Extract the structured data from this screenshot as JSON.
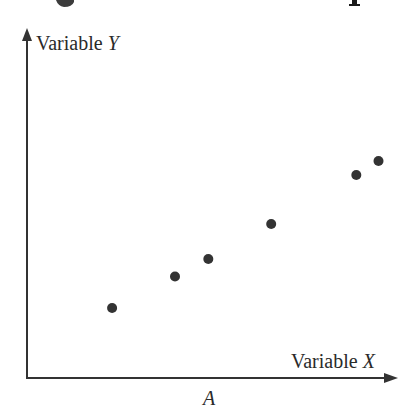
{
  "figure": {
    "title_fragment": "g                                    p",
    "caption": "A"
  },
  "colors": {
    "axis": "#333333",
    "point": "#333333",
    "text": "#2a2a2a",
    "background": "#ffffff"
  },
  "chart_data": {
    "type": "scatter",
    "title": "",
    "xlabel": "Variable X",
    "ylabel": "Variable Y",
    "caption": "A",
    "xlim": [
      0,
      10
    ],
    "ylim": [
      0,
      10
    ],
    "grid": false,
    "legend": null,
    "ticks": false,
    "points": [
      {
        "x": 2.3,
        "y": 2.0
      },
      {
        "x": 4.0,
        "y": 2.9
      },
      {
        "x": 4.9,
        "y": 3.4
      },
      {
        "x": 6.6,
        "y": 4.4
      },
      {
        "x": 8.9,
        "y": 5.8
      },
      {
        "x": 9.5,
        "y": 6.2
      }
    ],
    "trend": "positive linear correlation"
  }
}
